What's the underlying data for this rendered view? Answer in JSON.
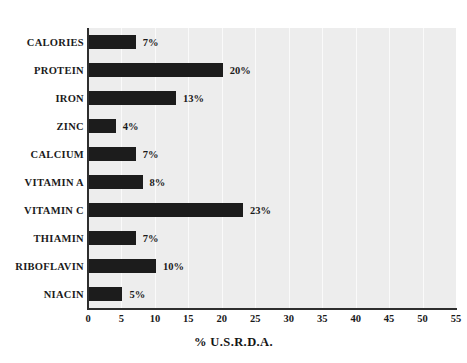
{
  "chart_data": {
    "type": "bar",
    "orientation": "horizontal",
    "title": "",
    "xlabel": "% U.S.R.D.A.",
    "ylabel": "",
    "xlim": [
      0,
      55
    ],
    "xticks": [
      "0",
      "5",
      "10",
      "15",
      "20",
      "25",
      "30",
      "35",
      "40",
      "45",
      "50",
      "55"
    ],
    "xtick_step": 5,
    "grid": "vertical",
    "legend": "none",
    "categories": [
      "CALORIES",
      "PROTEIN",
      "IRON",
      "ZINC",
      "CALCIUM",
      "VITAMIN A",
      "VITAMIN C",
      "THIAMIN",
      "RIBOFLAVIN",
      "NIACIN"
    ],
    "values": [
      7,
      20,
      13,
      4,
      7,
      8,
      23,
      7,
      10,
      5
    ],
    "value_labels": [
      "7%",
      "20%",
      "13%",
      "4%",
      "7%",
      "8%",
      "23%",
      "7%",
      "10%",
      "5%"
    ],
    "colors": {
      "bar": "#1c1c1c",
      "plot_background": "#ededed",
      "page_background": "#ffffff",
      "axis": "#2e2e2e",
      "gridline": "#fafafa",
      "text": "#1a1a1a"
    }
  }
}
